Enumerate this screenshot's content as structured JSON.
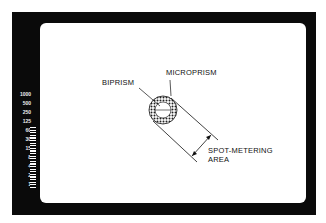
{
  "diagram": {
    "labels": {
      "microprism": "MICROPRISM",
      "biprism": "BIPRISM",
      "spot_metering_line1": "SPOT-METERING",
      "spot_metering_line2": "AREA"
    },
    "shutter_scale": [
      "1000",
      "500",
      "250",
      "125",
      "60",
      "30",
      "15",
      "8",
      "4",
      "2",
      "1"
    ],
    "colors": {
      "frame": "#0a0a0a",
      "background": "#ffffff",
      "text": "#111111"
    }
  }
}
